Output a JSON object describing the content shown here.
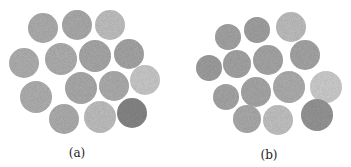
{
  "figure": {
    "panels": [
      {
        "label": "(a)",
        "label_pos": [
          77,
          146
        ],
        "circles": [
          {
            "cx": 43,
            "cy": 28,
            "r": 15,
            "shade": "#b3b3b3"
          },
          {
            "cx": 77,
            "cy": 25,
            "r": 15,
            "shade": "#b0b0b0"
          },
          {
            "cx": 110,
            "cy": 25,
            "r": 15,
            "shade": "#c6c6c6"
          },
          {
            "cx": 24,
            "cy": 63,
            "r": 15,
            "shade": "#b5b5b5"
          },
          {
            "cx": 61,
            "cy": 59,
            "r": 16,
            "shade": "#b4b4b4"
          },
          {
            "cx": 95,
            "cy": 56,
            "r": 16,
            "shade": "#adadad"
          },
          {
            "cx": 129,
            "cy": 54,
            "r": 15,
            "shade": "#aaaaaa"
          },
          {
            "cx": 145,
            "cy": 80,
            "r": 15,
            "shade": "#cfcfcf"
          },
          {
            "cx": 36,
            "cy": 97,
            "r": 16,
            "shade": "#b5b5b5"
          },
          {
            "cx": 81,
            "cy": 88,
            "r": 16,
            "shade": "#b0b0b0"
          },
          {
            "cx": 114,
            "cy": 86,
            "r": 15,
            "shade": "#b2b2b2"
          },
          {
            "cx": 64,
            "cy": 119,
            "r": 15,
            "shade": "#b3b3b3"
          },
          {
            "cx": 100,
            "cy": 117,
            "r": 16,
            "shade": "#c5c5c5"
          },
          {
            "cx": 132,
            "cy": 113,
            "r": 15,
            "shade": "#8a8a8a"
          }
        ]
      },
      {
        "label": "(b)",
        "label_pos": [
          269,
          148
        ],
        "circles": [
          {
            "cx": 228,
            "cy": 37,
            "r": 13,
            "shade": "#a9a9a9"
          },
          {
            "cx": 257,
            "cy": 30,
            "r": 13,
            "shade": "#a6a6a6"
          },
          {
            "cx": 291,
            "cy": 27,
            "r": 15,
            "shade": "#c4c4c4"
          },
          {
            "cx": 209,
            "cy": 68,
            "r": 13,
            "shade": "#a3a3a3"
          },
          {
            "cx": 237,
            "cy": 64,
            "r": 14,
            "shade": "#a9a9a9"
          },
          {
            "cx": 268,
            "cy": 60,
            "r": 15,
            "shade": "#ababab"
          },
          {
            "cx": 305,
            "cy": 55,
            "r": 15,
            "shade": "#aaaaaa"
          },
          {
            "cx": 326,
            "cy": 87,
            "r": 16,
            "shade": "#d3d3d3"
          },
          {
            "cx": 226,
            "cy": 97,
            "r": 13,
            "shade": "#ababab"
          },
          {
            "cx": 256,
            "cy": 92,
            "r": 15,
            "shade": "#acacac"
          },
          {
            "cx": 289,
            "cy": 87,
            "r": 16,
            "shade": "#b3b3b3"
          },
          {
            "cx": 247,
            "cy": 119,
            "r": 14,
            "shade": "#b0b0b0"
          },
          {
            "cx": 278,
            "cy": 120,
            "r": 15,
            "shade": "#c8c8c8"
          },
          {
            "cx": 317,
            "cy": 115,
            "r": 16,
            "shade": "#9a9a9a"
          }
        ]
      }
    ]
  }
}
